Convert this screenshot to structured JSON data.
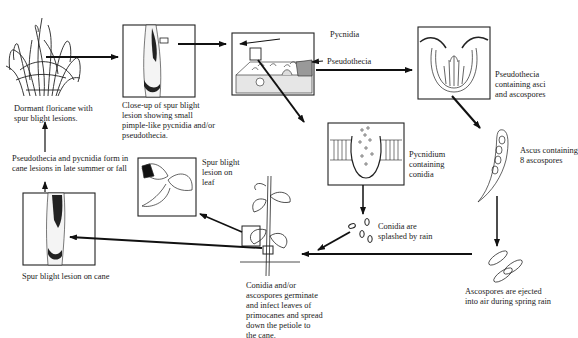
{
  "labels": {
    "dormant": "Dormant floricane with\nspur blight lesions.",
    "closeup": "Close-up of spur blight\nlesion showing small\npimple-like pycnidia and/or\npseudothecia.",
    "pycnidia": "Pycnidia",
    "pseudothecia_arrow": "Pseudothecia",
    "pseudothecia_asci": "Pseudothecia\ncontaining asci\nand ascospores",
    "pycnidium": "Pycnidium\ncontaining\nconidia",
    "ascus": "Ascus containing\n8 ascospores",
    "ascospores_ejected": "Ascospores are ejected\ninto air during spring rain",
    "conidia_splashed": "Conidia are\nsplashed by rain",
    "germinate": "Conidia and/or\nascospores germinate\nand infect leaves of\nprimocanes and spread\ndown the petiole to\nthe cane.",
    "leaf_lesion": "Spur blight\nlesion on\nleaf",
    "cane_lesion": "Spur blight lesion on cane",
    "form_in_cane": "Pseudothecia and pycnidia form in\ncane lesions in late summer or fall"
  }
}
